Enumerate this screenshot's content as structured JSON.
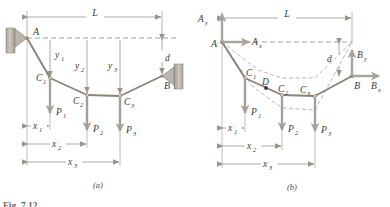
{
  "figure": {
    "type": "diagram",
    "panels": [
      {
        "id": "a",
        "caption": "(a)",
        "description": "Cable ACB supported at A and B carrying three concentrated loads"
      },
      {
        "id": "b",
        "caption": "(b)",
        "description": "Free-body diagram of cable showing support reactions"
      }
    ],
    "partial_caption": "Fig. 7.12"
  },
  "labels": {
    "point_A": "A",
    "point_B": "B",
    "point_C1": "C",
    "point_C1_sub": "1",
    "point_C2": "C",
    "point_C2_sub": "2",
    "point_C3": "C",
    "point_C3_sub": "3",
    "point_D": "D",
    "load_P1": "P",
    "load_P1_sub": "1",
    "load_P2": "P",
    "load_P2_sub": "2",
    "load_P3": "P",
    "load_P3_sub": "3",
    "span_L": "L",
    "sag_d": "d",
    "y1": "y",
    "y1_sub": "1",
    "y2": "y",
    "y2_sub": "2",
    "y3": "y",
    "y3_sub": "3",
    "x1": "x",
    "x1_sub": "1",
    "x2": "x",
    "x2_sub": "2",
    "x3": "x",
    "x3_sub": "3",
    "reaction_Ax": "A",
    "reaction_Ax_sub": "x",
    "reaction_Ay": "A",
    "reaction_Ay_sub": "y",
    "reaction_Bx": "B",
    "reaction_Bx_sub": "x",
    "reaction_By": "B",
    "reaction_By_sub": "y"
  },
  "colors": {
    "cable": "#8a8378",
    "load_arrow": "#a9a49a",
    "dimension": "#9a958c",
    "dashed": "#a8a49b",
    "support_fill": "#b9b5ac",
    "support_hatch": "#8f8a80",
    "text": "#3a3a3a",
    "reaction_arrow": "#a9a49a",
    "background": "#ffffff"
  },
  "geometry": {
    "panel_a": {
      "A": [
        27,
        38
      ],
      "C1": [
        50,
        78
      ],
      "C2": [
        87,
        95
      ],
      "C3": [
        120,
        96
      ],
      "B": [
        162,
        76
      ],
      "L_dim_y": 17,
      "x1_dim_y": 126,
      "x2_dim_y": 144,
      "x3_dim_y": 162
    },
    "panel_b": {
      "A": [
        222,
        42
      ],
      "C1": [
        245,
        78
      ],
      "C2": [
        282,
        95
      ],
      "C3": [
        315,
        96
      ],
      "D": [
        266,
        88
      ],
      "B": [
        352,
        76
      ],
      "L_dim_y": 18,
      "x1_dim_y": 128,
      "x2_dim_y": 146,
      "x3_dim_y": 164
    }
  }
}
